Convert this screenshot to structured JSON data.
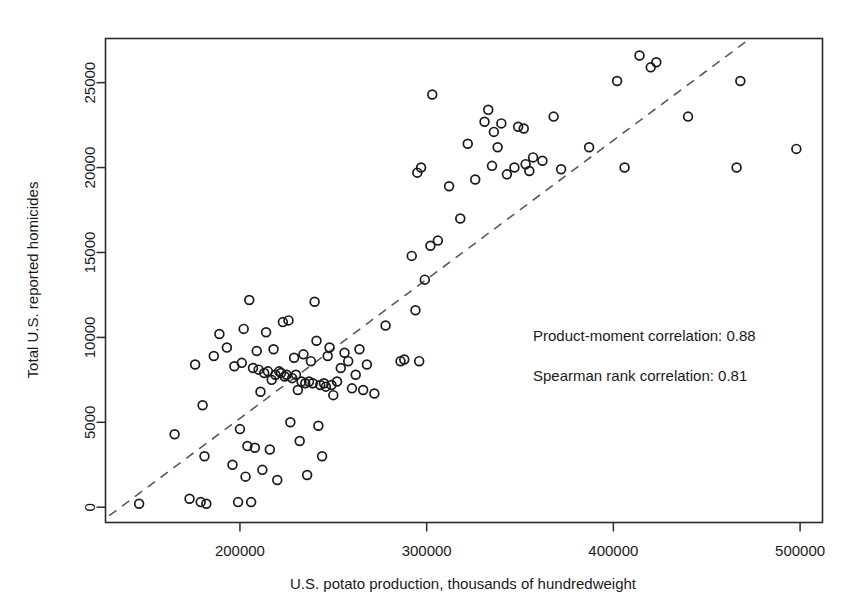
{
  "chart_data": {
    "type": "scatter",
    "title": "",
    "xlabel": "U.S. potato production, thousands of hundredweight",
    "ylabel": "Total U.S. reported homicides",
    "xlim": [
      128000,
      512000
    ],
    "ylim": [
      -900,
      27600
    ],
    "xticks": [
      200000,
      300000,
      400000,
      500000
    ],
    "xtick_labels": [
      "200000",
      "300000",
      "400000",
      "500000"
    ],
    "yticks": [
      0,
      5000,
      10000,
      15000,
      20000,
      25000
    ],
    "ytick_labels": [
      "0",
      "5000",
      "10000",
      "15000",
      "20000",
      "25000"
    ],
    "grid": false,
    "legend": "none",
    "marker": "open-circle",
    "annotations": [
      "Product-moment correlation: 0.88",
      "Spearman rank correlation: 0.81"
    ],
    "trend_line": {
      "style": "dashed",
      "x_start": 130000,
      "y_start": -500,
      "x_end": 472000,
      "y_end": 27500
    },
    "series": [
      {
        "name": "U.S. potato production vs. homicides",
        "points": [
          [
            146000,
            200
          ],
          [
            165000,
            4300
          ],
          [
            173000,
            500
          ],
          [
            176000,
            8400
          ],
          [
            179000,
            300
          ],
          [
            180000,
            6000
          ],
          [
            181000,
            3000
          ],
          [
            182000,
            200
          ],
          [
            186000,
            8900
          ],
          [
            189000,
            10200
          ],
          [
            193000,
            9400
          ],
          [
            196000,
            2500
          ],
          [
            197000,
            8300
          ],
          [
            199000,
            300
          ],
          [
            200000,
            4600
          ],
          [
            201000,
            8500
          ],
          [
            202000,
            10500
          ],
          [
            203000,
            1800
          ],
          [
            204000,
            3600
          ],
          [
            205000,
            12200
          ],
          [
            206000,
            300
          ],
          [
            207000,
            8200
          ],
          [
            208000,
            3500
          ],
          [
            209000,
            9200
          ],
          [
            210000,
            8100
          ],
          [
            211000,
            6800
          ],
          [
            212000,
            2200
          ],
          [
            213000,
            7900
          ],
          [
            214000,
            10300
          ],
          [
            215000,
            8000
          ],
          [
            216000,
            3400
          ],
          [
            217000,
            7500
          ],
          [
            218000,
            9300
          ],
          [
            219000,
            7800
          ],
          [
            220000,
            1600
          ],
          [
            221000,
            8000
          ],
          [
            222000,
            7900
          ],
          [
            223000,
            10900
          ],
          [
            224000,
            7700
          ],
          [
            225000,
            7800
          ],
          [
            226000,
            11000
          ],
          [
            227000,
            5000
          ],
          [
            228000,
            7600
          ],
          [
            229000,
            8800
          ],
          [
            230000,
            7800
          ],
          [
            231000,
            6900
          ],
          [
            232000,
            3900
          ],
          [
            233000,
            7400
          ],
          [
            234000,
            9000
          ],
          [
            235000,
            7300
          ],
          [
            236000,
            1900
          ],
          [
            237000,
            7400
          ],
          [
            238000,
            8600
          ],
          [
            239000,
            7300
          ],
          [
            240000,
            12100
          ],
          [
            241000,
            9800
          ],
          [
            242000,
            4800
          ],
          [
            243000,
            7200
          ],
          [
            244000,
            3000
          ],
          [
            245000,
            7300
          ],
          [
            246000,
            7100
          ],
          [
            247000,
            8900
          ],
          [
            248000,
            9400
          ],
          [
            249000,
            7200
          ],
          [
            250000,
            6600
          ],
          [
            252000,
            7400
          ],
          [
            254000,
            8200
          ],
          [
            256000,
            9100
          ],
          [
            258000,
            8600
          ],
          [
            260000,
            7000
          ],
          [
            262000,
            7800
          ],
          [
            264000,
            9300
          ],
          [
            266000,
            6900
          ],
          [
            268000,
            8400
          ],
          [
            272000,
            6700
          ],
          [
            278000,
            10700
          ],
          [
            286000,
            8600
          ],
          [
            288000,
            8700
          ],
          [
            292000,
            14800
          ],
          [
            294000,
            11600
          ],
          [
            295000,
            19700
          ],
          [
            296000,
            8600
          ],
          [
            297000,
            20000
          ],
          [
            299000,
            13400
          ],
          [
            302000,
            15400
          ],
          [
            303000,
            24300
          ],
          [
            306000,
            15700
          ],
          [
            312000,
            18900
          ],
          [
            318000,
            17000
          ],
          [
            322000,
            21400
          ],
          [
            326000,
            19300
          ],
          [
            331000,
            22700
          ],
          [
            333000,
            23400
          ],
          [
            335000,
            20100
          ],
          [
            336000,
            22100
          ],
          [
            338000,
            21200
          ],
          [
            340000,
            22600
          ],
          [
            343000,
            19600
          ],
          [
            347000,
            20000
          ],
          [
            349000,
            22400
          ],
          [
            352000,
            22300
          ],
          [
            353000,
            20200
          ],
          [
            355000,
            19800
          ],
          [
            357000,
            20600
          ],
          [
            362000,
            20400
          ],
          [
            368000,
            23000
          ],
          [
            372000,
            19900
          ],
          [
            387000,
            21200
          ],
          [
            402000,
            25100
          ],
          [
            406000,
            20000
          ],
          [
            414000,
            26600
          ],
          [
            420000,
            25900
          ],
          [
            423000,
            26200
          ],
          [
            440000,
            23000
          ],
          [
            466000,
            20000
          ],
          [
            468000,
            25100
          ],
          [
            498000,
            21100
          ]
        ]
      }
    ]
  },
  "axes": {
    "y_axis_title": "Total U.S. reported homicides",
    "x_axis_title": "U.S. potato production, thousands of hundredweight"
  },
  "annotations": {
    "product_moment": "Product-moment correlation: 0.88",
    "spearman_rank": "Spearman rank correlation: 0.81"
  }
}
